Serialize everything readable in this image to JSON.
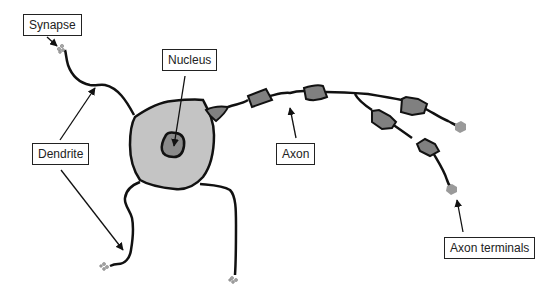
{
  "diagram": {
    "labels": {
      "synapse": "Synapse",
      "nucleus": "Nucleus",
      "dendrite": "Dendrite",
      "axon": "Axon",
      "axon_terminals": "Axon terminals"
    },
    "colors": {
      "cell_body": "#c4c4c4",
      "nucleus": "#8a8a8a",
      "myelin": "#808080",
      "terminal": "#9a9a9a",
      "outline": "#111111"
    }
  }
}
